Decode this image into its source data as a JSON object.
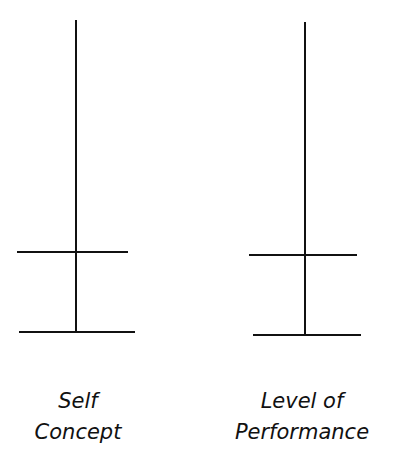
{
  "diagram": {
    "line_color": "#111111",
    "scales": [
      {
        "id": "self-concept",
        "label_lines": [
          "Self",
          "Concept"
        ],
        "vertical": {
          "x": 76,
          "y1": 20,
          "y2": 332
        },
        "crossbar": {
          "y": 252,
          "x1": 17,
          "x2": 128
        },
        "base": {
          "y": 332,
          "x1": 19,
          "x2": 135
        }
      },
      {
        "id": "level-of-performance",
        "label_lines": [
          "Level of",
          "Performance"
        ],
        "vertical": {
          "x": 305,
          "y1": 22,
          "y2": 335
        },
        "crossbar": {
          "y": 255,
          "x1": 249,
          "x2": 357
        },
        "base": {
          "y": 335,
          "x1": 253,
          "x2": 361
        }
      }
    ]
  }
}
